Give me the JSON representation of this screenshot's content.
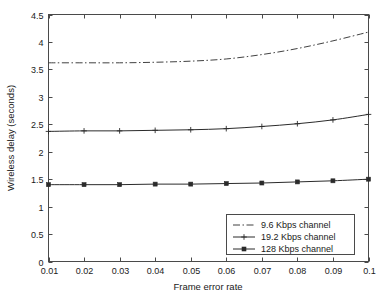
{
  "chart_data": {
    "type": "line",
    "title": "",
    "xlabel": "Frame error rate",
    "ylabel": "Wireless delay (seconds)",
    "x": [
      0.01,
      0.02,
      0.03,
      0.04,
      0.05,
      0.06,
      0.07,
      0.08,
      0.09,
      0.1
    ],
    "xlim": [
      0.01,
      0.1
    ],
    "ylim": [
      0,
      4.5
    ],
    "xticks": [
      "0.01",
      "0.02",
      "0.03",
      "0.04",
      "0.05",
      "0.06",
      "0.07",
      "0.08",
      "0.09",
      "0.1"
    ],
    "yticks": [
      "0",
      "0.5",
      "1",
      "1.5",
      "2",
      "2.5",
      "3",
      "3.5",
      "4",
      "4.5"
    ],
    "grid": false,
    "legend_position": "lower right",
    "series": [
      {
        "name": "9.6 Kbps channel",
        "style": "dash-dot",
        "marker": "none",
        "color": "#2b2b2b",
        "values": [
          3.62,
          3.62,
          3.62,
          3.63,
          3.65,
          3.69,
          3.77,
          3.88,
          4.02,
          4.18
        ]
      },
      {
        "name": "19.2 Kbps channel",
        "style": "solid",
        "marker": "plus",
        "color": "#2b2b2b",
        "values": [
          2.37,
          2.38,
          2.38,
          2.39,
          2.4,
          2.42,
          2.46,
          2.51,
          2.58,
          2.68
        ]
      },
      {
        "name": "128 Kbps channel",
        "style": "solid",
        "marker": "square",
        "color": "#2b2b2b",
        "values": [
          1.4,
          1.4,
          1.4,
          1.41,
          1.41,
          1.42,
          1.43,
          1.45,
          1.47,
          1.5
        ]
      }
    ]
  },
  "legend": {
    "entries": [
      {
        "label": "9.6 Kbps channel"
      },
      {
        "label": "19.2 Kbps channel"
      },
      {
        "label": "128 Kbps channel"
      }
    ]
  }
}
